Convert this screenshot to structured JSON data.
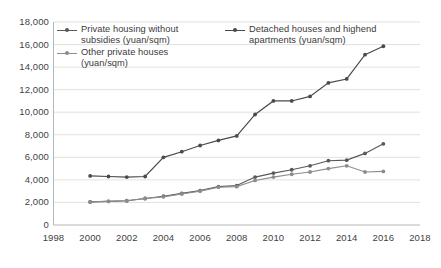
{
  "chart_data": {
    "type": "line",
    "title": "",
    "xlabel": "",
    "ylabel": "",
    "xlim": [
      1998,
      2018
    ],
    "ylim": [
      0,
      18000
    ],
    "grid": true,
    "legend_position": "top-left-inside",
    "x_tick_labels": [
      "1998",
      "2000",
      "2002",
      "2004",
      "2006",
      "2008",
      "2010",
      "2012",
      "2014",
      "2016",
      "2018"
    ],
    "y_tick_labels": [
      "0",
      "2,000",
      "4,000",
      "6,000",
      "8,000",
      "10,000",
      "12,000",
      "14,000",
      "16,000",
      "18,000"
    ],
    "x_ticks": [
      1998,
      2000,
      2002,
      2004,
      2006,
      2008,
      2010,
      2012,
      2014,
      2016,
      2018
    ],
    "y_ticks": [
      0,
      2000,
      4000,
      6000,
      8000,
      10000,
      12000,
      14000,
      16000,
      18000
    ],
    "x": [
      2000,
      2001,
      2002,
      2003,
      2004,
      2005,
      2006,
      2007,
      2008,
      2009,
      2010,
      2011,
      2012,
      2013,
      2014,
      2015,
      2016
    ],
    "series": [
      {
        "name": "Private housing without subsidies (yuan/sqm)",
        "color": "#595959",
        "marker": "circle",
        "values": [
          2050,
          2100,
          2150,
          2350,
          2550,
          2800,
          3050,
          3400,
          3500,
          4250,
          4600,
          4900,
          5250,
          5700,
          5750,
          6350,
          7200
        ]
      },
      {
        "name": "Detached houses and highend apartments (yuan/sqm)",
        "color": "#4a4a4a",
        "marker": "circle",
        "values": [
          4350,
          4300,
          4250,
          4300,
          6000,
          6500,
          7050,
          7500,
          7900,
          9800,
          11000,
          11000,
          11400,
          12600,
          12950,
          15100,
          15850
        ]
      },
      {
        "name": "Other private houses (yuan/sqm)",
        "color": "#8c8c8c",
        "marker": "circle",
        "values": [
          2050,
          2100,
          2150,
          2350,
          2500,
          2750,
          3000,
          3350,
          3400,
          3950,
          4250,
          4500,
          4700,
          5000,
          5250,
          4700,
          4750
        ]
      }
    ]
  },
  "axes": {
    "y_tick_labels": [
      "18,000",
      "16,000",
      "14,000",
      "12,000",
      "10,000",
      "8,000",
      "6,000",
      "4,000",
      "2,000",
      "0"
    ],
    "x_tick_labels": [
      "1998",
      "2000",
      "2002",
      "2004",
      "2006",
      "2008",
      "2010",
      "2012",
      "2014",
      "2016",
      "2018"
    ]
  },
  "legend": {
    "items": [
      {
        "label": "Private housing without\nsubsidies (yuan/sqm)",
        "color": "#595959"
      },
      {
        "label": "Detached houses and highend\napartments (yuan/sqm)",
        "color": "#4a4a4a"
      },
      {
        "label": "Other private houses\n(yuan/sqm)",
        "color": "#8c8c8c"
      }
    ]
  },
  "style": {
    "grid_color": "#d9d9d9",
    "axis_color": "#b7b7b7",
    "text_color": "#3a3a3a",
    "background": "#ffffff"
  }
}
